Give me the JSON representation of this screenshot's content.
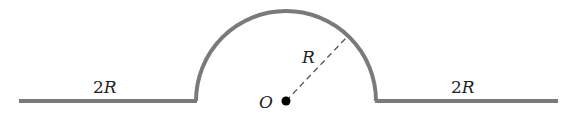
{
  "diagram": {
    "colors": {
      "wire": "#7a7a7a",
      "dash": "#555555",
      "dot": "#000000",
      "text": "#222222"
    },
    "labels": {
      "left_length": "2R",
      "right_length": "2R",
      "radius": "R",
      "center": "O"
    },
    "geometry": {
      "center": [
        286,
        101
      ],
      "radius_px": 90,
      "left_segment": [
        [
          19,
          101
        ],
        [
          196,
          101
        ]
      ],
      "right_segment": [
        [
          376,
          101
        ],
        [
          558,
          101
        ]
      ],
      "radius_line_end": [
        346,
        38
      ]
    }
  }
}
